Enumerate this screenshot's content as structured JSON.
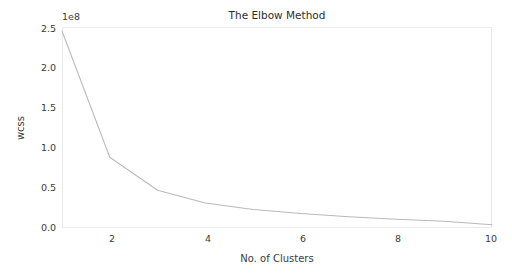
{
  "chart_data": {
    "type": "line",
    "title": "The Elbow Method",
    "xlabel": "No. of Clusters",
    "ylabel": "wcss",
    "y_offset_text": "1e8",
    "y_offset_factor": 100000000,
    "x": [
      1,
      2,
      3,
      4,
      5,
      6,
      7,
      8,
      9,
      10
    ],
    "values": [
      245000000,
      88000000,
      47000000,
      31000000,
      23000000,
      18000000,
      14000000,
      11000000,
      8500000,
      4000000
    ],
    "values_scaled": [
      2.45,
      0.88,
      0.47,
      0.31,
      0.23,
      0.18,
      0.14,
      0.11,
      0.085,
      0.04
    ],
    "xlim": [
      1,
      10
    ],
    "ylim": [
      0.0,
      2.5
    ],
    "xticks": [
      2,
      4,
      6,
      8,
      10
    ],
    "xtick_labels": [
      "2",
      "4",
      "6",
      "8",
      "10"
    ],
    "yticks": [
      0.0,
      0.5,
      1.0,
      1.5,
      2.0,
      2.5
    ],
    "ytick_labels": [
      "0.0",
      "0.5",
      "1.0",
      "1.5",
      "2.0",
      "2.5"
    ],
    "grid": false,
    "legend": false,
    "legend_position": "none",
    "line_color": "#b9b9b9",
    "axis_color": "#eaeaea",
    "text_color": "#3b3b3b",
    "background_color": "#ffffff"
  },
  "plot_geometry": {
    "left": 62,
    "right": 492,
    "top": 27,
    "bottom": 228
  }
}
